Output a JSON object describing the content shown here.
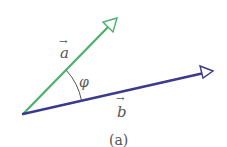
{
  "diagram": {
    "caption": "(a)",
    "vector_a": {
      "label": "a",
      "arrow_glyph": "→",
      "color": "#4caf6a",
      "origin": [
        23,
        114
      ],
      "tip": [
        117,
        18
      ]
    },
    "vector_b": {
      "label": "b",
      "arrow_glyph": "→",
      "color": "#3c3a8c",
      "origin": [
        23,
        114
      ],
      "tip": [
        213,
        71
      ]
    },
    "angle": {
      "label": "φ",
      "arc_color": "#555555"
    }
  }
}
